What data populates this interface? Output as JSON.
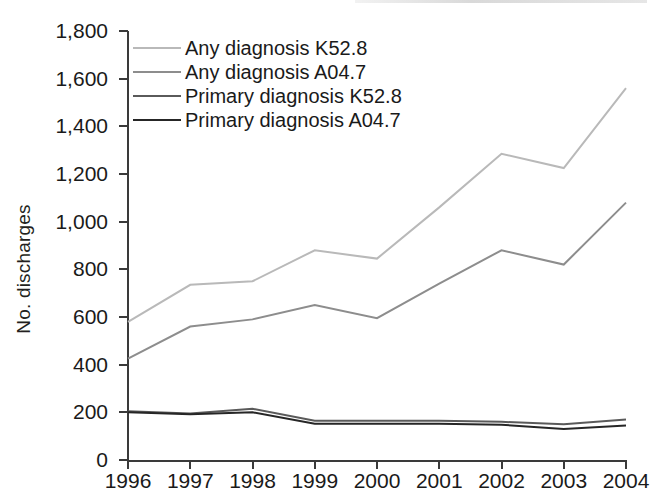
{
  "chart_data": {
    "type": "line",
    "title": "",
    "xlabel": "",
    "ylabel": "No. discharges",
    "categories": [
      "1996",
      "1997",
      "1998",
      "1999",
      "2000",
      "2001",
      "2002",
      "2003",
      "2004"
    ],
    "x": [
      1996,
      1997,
      1998,
      1999,
      2000,
      2001,
      2002,
      2003,
      2004
    ],
    "ylim": [
      0,
      1800
    ],
    "yticks": [
      0,
      200,
      400,
      600,
      800,
      1000,
      1200,
      1400,
      1600,
      1800
    ],
    "ytick_labels": [
      "0",
      "200",
      "400",
      "600",
      "800",
      "1,000",
      "1,200",
      "1,400",
      "1,600",
      "1,800"
    ],
    "grid": false,
    "legend_position": "top-left",
    "series": [
      {
        "name": "Any diagnosis K52.8",
        "color": "#b9b9b9",
        "values": [
          580,
          735,
          750,
          880,
          845,
          1060,
          1285,
          1225,
          1560
        ]
      },
      {
        "name": "Any diagnosis A04.7",
        "color": "#8d8d8d",
        "values": [
          425,
          560,
          590,
          650,
          595,
          740,
          880,
          820,
          1080
        ]
      },
      {
        "name": "Primary diagnosis K52.8",
        "color": "#5a5a5a",
        "values": [
          205,
          195,
          215,
          165,
          165,
          165,
          160,
          150,
          170
        ]
      },
      {
        "name": "Primary diagnosis A04.7",
        "color": "#262626",
        "values": [
          200,
          192,
          200,
          152,
          152,
          152,
          148,
          130,
          145
        ]
      }
    ]
  },
  "axis": {
    "y_label": "No. discharges"
  },
  "legend": {
    "items": [
      {
        "label": "Any diagnosis K52.8"
      },
      {
        "label": "Any diagnosis A04.7"
      },
      {
        "label": "Primary diagnosis K52.8"
      },
      {
        "label": "Primary diagnosis A04.7"
      }
    ]
  }
}
